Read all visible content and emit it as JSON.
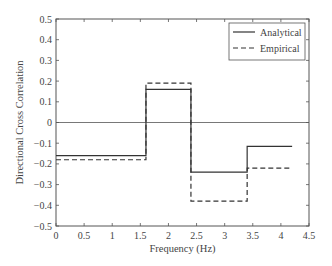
{
  "chart_data": {
    "type": "line",
    "title": "",
    "xlabel": "Frequency (Hz)",
    "ylabel": "Directional Cross Correlation",
    "xlim": [
      0,
      4.5
    ],
    "ylim": [
      -0.5,
      0.5
    ],
    "grid": false,
    "legend_position": "upper right",
    "x_ticks": [
      "0",
      "0.5",
      "1",
      "1.5",
      "2",
      "2.5",
      "3",
      "3.5",
      "4",
      "4.5"
    ],
    "y_ticks": [
      "0.5",
      "0.4",
      "0.3",
      "0.2",
      "0.1",
      "0",
      "−0.1",
      "−0.2",
      "−0.3",
      "−0.4",
      "−0.5"
    ],
    "series": [
      {
        "name": "Analytical",
        "style": "solid",
        "step_edges": [
          0,
          1.6,
          2.4,
          3.4,
          4.2
        ],
        "values": [
          -0.16,
          0.16,
          -0.24,
          -0.115
        ]
      },
      {
        "name": "Empirical",
        "style": "dashed",
        "step_edges": [
          0,
          1.6,
          2.4,
          3.4,
          4.2
        ],
        "values": [
          -0.18,
          0.19,
          -0.38,
          -0.22
        ]
      }
    ],
    "reference_line": {
      "y": 0
    }
  },
  "legend": {
    "items": [
      "Analytical",
      "Empirical"
    ]
  }
}
